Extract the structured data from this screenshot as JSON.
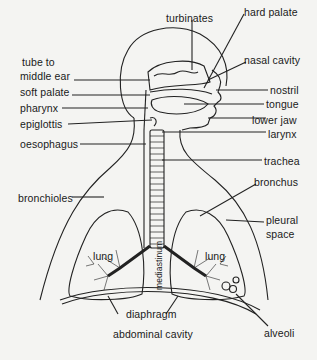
{
  "diagram": {
    "type": "anatomical-labeled-diagram",
    "colors": {
      "background": "#f4f4f2",
      "ink": "#1a1a1a",
      "line": "#222222"
    },
    "labels": {
      "turbinates": "turbinates",
      "hard_palate": "hard palate",
      "tube_to_middle_ear_1": "tube to",
      "tube_to_middle_ear_2": "middle ear",
      "nasal_cavity": "nasal cavity",
      "soft_palate": "soft palate",
      "nostril": "nostril",
      "pharynx": "pharynx",
      "tongue": "tongue",
      "epiglottis": "epiglottis",
      "lower_jaw": "lower jaw",
      "larynx": "larynx",
      "oesophagus": "oesophagus",
      "trachea": "trachea",
      "bronchioles": "bronchioles",
      "bronchus": "bronchus",
      "pleural_space_1": "pleural",
      "pleural_space_2": "space",
      "lung_left": "lung",
      "lung_right": "lung",
      "mediastinum": "mediastinum",
      "diaphragm": "diaphragm",
      "abdominal_cavity": "abdominal cavity",
      "alveoli": "alveoli"
    }
  }
}
